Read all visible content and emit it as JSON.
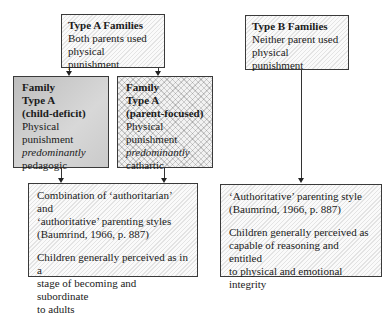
{
  "type_a": {
    "title": "Type A Families",
    "line1": "Both parents used",
    "line2": "physical punishment"
  },
  "type_b": {
    "title": "Type B Families",
    "line1": "Neither parent used",
    "line2": "physical punishment"
  },
  "child_deficit": {
    "title1": "Family",
    "title2": "Type A",
    "title3": "(child-deficit)",
    "line1": "Physical",
    "line2": "punishment",
    "line3": "predominantly",
    "line4": "pedagogic"
  },
  "parent_focused": {
    "title1": "Family",
    "title2": "Type A",
    "title3": "(parent-focused)",
    "line1": "Physical",
    "line2": "punishment",
    "line3": "predominantly",
    "line4": "cathartic"
  },
  "outcome_a": {
    "line1": "Combination of ‘authoritarian’ and",
    "line2": "‘authoritative’ parenting styles",
    "line3": "(Baumrind, 1966, p. 887)",
    "line4": "Children generally perceived as in a",
    "line5": "stage of becoming and subordinate",
    "line6": "to adults"
  },
  "outcome_b": {
    "line1": "‘Authoritative’ parenting style",
    "line2": "(Baumrind, 1966, p. 887)",
    "line3": "Children generally perceived as",
    "line4": "capable of reasoning and entitled",
    "line5": "to physical and emotional",
    "line6": "integrity"
  }
}
